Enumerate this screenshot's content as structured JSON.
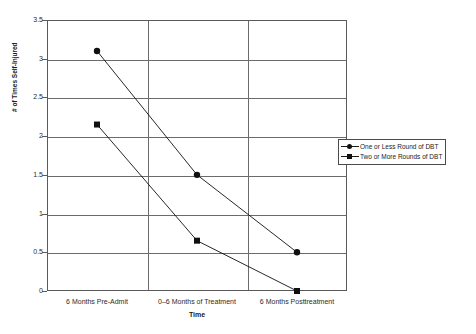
{
  "chart_data": {
    "type": "line",
    "title": "",
    "xlabel": "Time",
    "ylabel": "# of Times Self-Injured",
    "categories": [
      "6 Months Pre-Admit",
      "0–6 Months of Treatment",
      "6 Months Posttreatment"
    ],
    "ylim": [
      0,
      3.5
    ],
    "yticks": [
      0,
      0.5,
      1,
      1.5,
      2,
      2.5,
      3,
      3.5
    ],
    "ytick_labels": [
      "0",
      "0.5",
      "1",
      "1.5",
      "2",
      "2.5",
      "3",
      "3.5"
    ],
    "grid": true,
    "legend_position": "right",
    "series": [
      {
        "name": "One or Less Round of DBT",
        "marker": "circle",
        "color": "#101010",
        "values": [
          3.1,
          1.5,
          0.5
        ]
      },
      {
        "name": "Two or More Rounds of DBT",
        "marker": "square",
        "color": "#101010",
        "values": [
          2.15,
          0.65,
          0.0
        ]
      }
    ]
  },
  "legend": {
    "items": [
      {
        "label": "One or Less Round of DBT",
        "marker": "circle"
      },
      {
        "label": "Two or More Rounds of DBT",
        "marker": "square"
      }
    ]
  }
}
